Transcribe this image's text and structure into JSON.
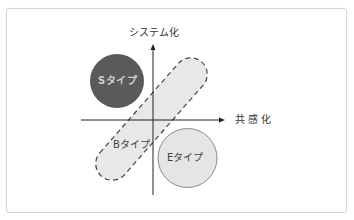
{
  "diagram": {
    "axes": {
      "vertical_label": "システム化",
      "horizontal_label": "共感化"
    },
    "regions": [
      {
        "id": "s-type",
        "label": "Sタイプ",
        "shape": "circle",
        "fill": "#5a5a5a",
        "stroke": "none"
      },
      {
        "id": "b-type",
        "label": "Bタイプ",
        "shape": "dashed-capsule",
        "fill": "#e8e8e8",
        "stroke": "#444444"
      },
      {
        "id": "e-type",
        "label": "Eタイプ",
        "shape": "circle",
        "fill": "#e5e5e5",
        "stroke": "#8a8a8a"
      }
    ]
  },
  "colors": {
    "axis": "#222222",
    "frame": "#d4d4d4",
    "s_fill": "#5a5a5a",
    "e_fill": "#e5e5e5",
    "b_fill": "#e8e8e8"
  }
}
